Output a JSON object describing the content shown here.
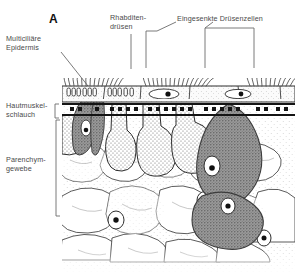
{
  "figure": {
    "panel_label": "A",
    "background_color": "#ffffff",
    "ink_color": "#3a3a3a"
  },
  "labels": {
    "epidermis": "Multiciliäre\nEpidermis",
    "rhabdite_glands": "Rhabditen-\ndrüsen",
    "sunken_gland_cells": "Eingesenkte Drüsenzellen",
    "muscle_sac": "Hautmuskel-\nschlauch",
    "parenchyma": "Parenchym-\ngewebe"
  },
  "structures": {
    "cilia_layer": "cilia-tufts",
    "epidermis_band": "epidermis-with-rhabdites",
    "muscle_band": "circular-longitudinal-muscle-layer",
    "dark_gland_cells": "dark-stained-gland-cells",
    "stippled_gland_cells": "stippled-gland-cells",
    "parenchyma_cells": "parenchyma-cell-network",
    "nucleus": "cell-nucleus"
  },
  "colors": {
    "dark_gland": "#8d8d8d",
    "dark_gland_edge": "#4a4a4a",
    "stipple": "#6f6f6f",
    "muscle_dots": "#1a1a1a",
    "outline": "#2e2e2e",
    "leader": "#6b6b6b"
  }
}
